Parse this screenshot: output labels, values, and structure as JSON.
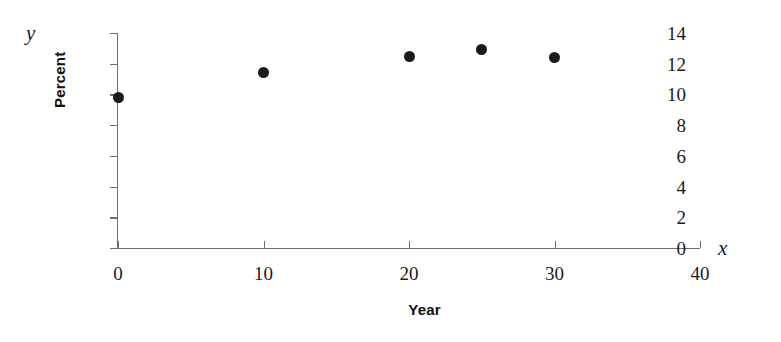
{
  "chart_data": {
    "type": "scatter",
    "title": "",
    "xlabel": "Year",
    "ylabel": "Percent",
    "x_axis_variable": "x",
    "y_axis_variable": "y",
    "xlim": [
      0,
      40
    ],
    "ylim": [
      0,
      14
    ],
    "x_ticks": [
      0,
      10,
      20,
      30,
      40
    ],
    "y_ticks": [
      0,
      2,
      4,
      6,
      8,
      10,
      12,
      14
    ],
    "grid": false,
    "legend": false,
    "marker": "filled-circle",
    "marker_color": "#1b1b1b",
    "axis_color": "#6e6e6e",
    "background": "#ffffff",
    "points": [
      {
        "x": 0,
        "y": 9.8
      },
      {
        "x": 10,
        "y": 11.4
      },
      {
        "x": 20,
        "y": 12.5
      },
      {
        "x": 25,
        "y": 12.9
      },
      {
        "x": 30,
        "y": 12.4
      }
    ]
  }
}
